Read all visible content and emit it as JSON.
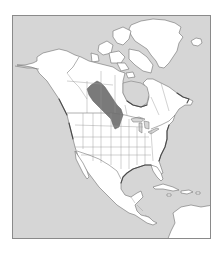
{
  "map": {
    "region": "North America",
    "type": "species range map",
    "colors": {
      "water": "#d6d6d6",
      "land": "#ffffff",
      "range": "#7a7a7a",
      "outline": "#6e6e6e",
      "frame": "#8a8a8a"
    },
    "range": {
      "label": "breeding range",
      "description": "Northern Great Plains / Prairie Provinces: central Alberta, Saskatchewan and Manitoba south to the U.S.–Canada border"
    },
    "regions_shown": [
      "Alaska",
      "Canada",
      "Greenland",
      "Iceland",
      "United States",
      "Mexico",
      "Central America",
      "Caribbean",
      "Northern South America"
    ]
  }
}
